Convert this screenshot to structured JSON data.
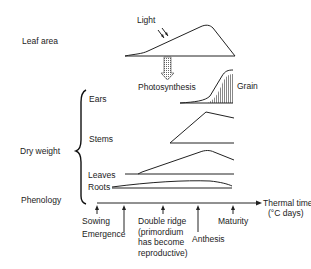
{
  "diagram": {
    "row_labels": {
      "leaf_area": "Leaf area",
      "dry_weight": "Dry weight",
      "phenology": "Phenology"
    },
    "annotations": {
      "light": "Light",
      "photosynthesis": "Photosynthesis",
      "grain": "Grain"
    },
    "organs": [
      "Ears",
      "Stems",
      "Leaves",
      "Roots"
    ],
    "axis": {
      "label_line1": "Thermal time",
      "label_line2": "(°C days)"
    },
    "stages": [
      {
        "label": "Sowing"
      },
      {
        "label": "Emergence"
      },
      {
        "label": "Double ridge\n(primordium\nhas become\nreproductive)"
      },
      {
        "label": "Anthesis"
      },
      {
        "label": "Maturity"
      }
    ],
    "colors": {
      "line": "#222222",
      "hatch": "#555555"
    }
  }
}
